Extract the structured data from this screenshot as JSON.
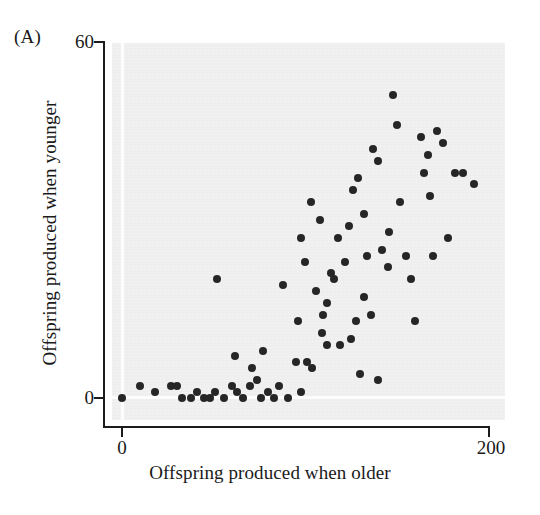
{
  "figure": {
    "panel_label": "(A)",
    "background_color": "#eeeeee",
    "point_color": "#262626",
    "axis_color": "#1c1c1c"
  },
  "axes": {
    "x_title": "Offspring produced when older",
    "y_title": "Offspring produced when younger",
    "x_ticks": [
      "0",
      "200"
    ],
    "y_ticks": [
      "0",
      "60"
    ]
  },
  "chart_data": {
    "type": "scatter",
    "title": "(A)",
    "xlabel": "Offspring produced when older",
    "ylabel": "Offspring produced when younger",
    "xlim": [
      0,
      200
    ],
    "ylim": [
      0,
      60
    ],
    "xticks": [
      0,
      200
    ],
    "yticks": [
      0,
      60
    ],
    "grid": false,
    "legend": false,
    "n_points": 78,
    "series": [
      {
        "name": "individuals",
        "points": [
          [
            0,
            0
          ],
          [
            10,
            2
          ],
          [
            18,
            1
          ],
          [
            27,
            2
          ],
          [
            33,
            0
          ],
          [
            38,
            0
          ],
          [
            41,
            1
          ],
          [
            45,
            0
          ],
          [
            48,
            0
          ],
          [
            51,
            1
          ],
          [
            56,
            0
          ],
          [
            63,
            1
          ],
          [
            66,
            0
          ],
          [
            70,
            2
          ],
          [
            71,
            5
          ],
          [
            74,
            3
          ],
          [
            76,
            0
          ],
          [
            77,
            8
          ],
          [
            80,
            1
          ],
          [
            83,
            0
          ],
          [
            86,
            2
          ],
          [
            91,
            0
          ],
          [
            96,
            13
          ],
          [
            98,
            1
          ],
          [
            104,
            5
          ],
          [
            106,
            18
          ],
          [
            109,
            11
          ],
          [
            112,
            9
          ],
          [
            112,
            16
          ],
          [
            114,
            21
          ],
          [
            116,
            20
          ],
          [
            119,
            9
          ],
          [
            122,
            23
          ],
          [
            125,
            10
          ],
          [
            128,
            13
          ],
          [
            130,
            4
          ],
          [
            132,
            17
          ],
          [
            134,
            24
          ],
          [
            136,
            14
          ],
          [
            140,
            3
          ],
          [
            30,
            2
          ],
          [
            52,
            20
          ],
          [
            88,
            19
          ],
          [
            98,
            27
          ],
          [
            100,
            23
          ],
          [
            103,
            33
          ],
          [
            108,
            30
          ],
          [
            118,
            27
          ],
          [
            124,
            29
          ],
          [
            126,
            35
          ],
          [
            129,
            37
          ],
          [
            132,
            31
          ],
          [
            137,
            42
          ],
          [
            140,
            40
          ],
          [
            142,
            25
          ],
          [
            145,
            22
          ],
          [
            146,
            28
          ],
          [
            148,
            51
          ],
          [
            150,
            46
          ],
          [
            152,
            33
          ],
          [
            155,
            24
          ],
          [
            158,
            20
          ],
          [
            160,
            13
          ],
          [
            163,
            44
          ],
          [
            165,
            38
          ],
          [
            167,
            41
          ],
          [
            168,
            34
          ],
          [
            170,
            24
          ],
          [
            172,
            45
          ],
          [
            175,
            43
          ],
          [
            178,
            27
          ],
          [
            182,
            38
          ],
          [
            186,
            38
          ],
          [
            192,
            36
          ],
          [
            60,
            2
          ],
          [
            62,
            7
          ],
          [
            95,
            6
          ],
          [
            101,
            6
          ],
          [
            110,
            14
          ]
        ]
      }
    ]
  }
}
